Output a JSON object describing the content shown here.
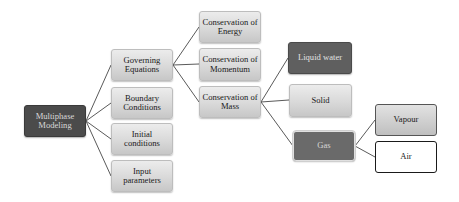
{
  "diagram": {
    "type": "tree",
    "orientation": "left-to-right",
    "root": {
      "id": "multiphase",
      "label": "Multiphase Modeling"
    },
    "nodes": {
      "multiphase": {
        "label": "Multiphase Modeling",
        "style": "dark"
      },
      "governing": {
        "label": "Governing Equations",
        "style": "light"
      },
      "boundary": {
        "label": "Boundary Conditions",
        "style": "light"
      },
      "initial": {
        "label": "Initial conditions",
        "style": "light"
      },
      "input": {
        "label": "Input parameters",
        "style": "light"
      },
      "energy": {
        "label": "Conservation of Energy",
        "style": "light"
      },
      "momentum": {
        "label": "Conservation of Momentum",
        "style": "light"
      },
      "mass": {
        "label": "Conservation of Mass",
        "style": "light"
      },
      "liquid": {
        "label": "Liquid water",
        "style": "dark"
      },
      "solid": {
        "label": "Solid",
        "style": "light"
      },
      "gas": {
        "label": "Gas",
        "style": "dark"
      },
      "vapour": {
        "label": "Vapour",
        "style": "gradient-outlined"
      },
      "air": {
        "label": "Air",
        "style": "white-outlined"
      }
    },
    "edges": [
      [
        "multiphase",
        "governing"
      ],
      [
        "multiphase",
        "boundary"
      ],
      [
        "multiphase",
        "initial"
      ],
      [
        "multiphase",
        "input"
      ],
      [
        "governing",
        "energy"
      ],
      [
        "governing",
        "momentum"
      ],
      [
        "governing",
        "mass"
      ],
      [
        "mass",
        "liquid"
      ],
      [
        "mass",
        "solid"
      ],
      [
        "mass",
        "gas"
      ],
      [
        "gas",
        "vapour"
      ],
      [
        "gas",
        "air"
      ]
    ],
    "colors": {
      "dark_node": "#5f5f5f",
      "root_node": "#4b4b4b",
      "light_node_top": "#ececec",
      "light_node_bottom": "#c7c7c7",
      "connector": "#5a5a5a",
      "air_border": "#1a1a1a"
    }
  }
}
